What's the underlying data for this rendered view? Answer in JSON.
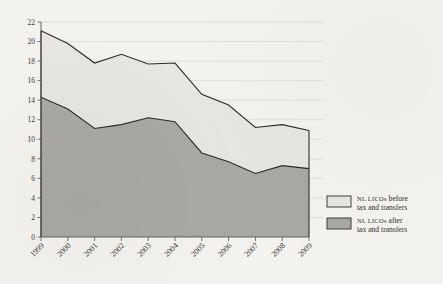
{
  "chart_data": {
    "type": "area",
    "title": "",
    "subtitle": "",
    "xlabel": "",
    "ylabel": "",
    "categories": [
      "1999",
      "2000",
      "2001",
      "2002",
      "2003",
      "2004",
      "2005",
      "2006",
      "2007",
      "2008",
      "2009"
    ],
    "x": [
      1999,
      2000,
      2001,
      2002,
      2003,
      2004,
      2005,
      2006,
      2007,
      2008,
      2009
    ],
    "series": [
      {
        "name": "NL LICOs before tax and transfers",
        "color": "#e6e5e2",
        "values": [
          21.1,
          19.8,
          17.8,
          18.7,
          17.7,
          17.8,
          14.6,
          13.5,
          11.2,
          11.5,
          10.9
        ]
      },
      {
        "name": "NL LICOs after tax and transfers",
        "color": "#a9a8a5",
        "values": [
          14.3,
          13.1,
          11.1,
          11.5,
          12.2,
          11.8,
          8.6,
          7.7,
          6.5,
          7.3,
          7.0
        ]
      }
    ],
    "ylim": [
      0,
      22
    ],
    "yticks": [
      0,
      2,
      4,
      6,
      8,
      10,
      12,
      14,
      16,
      18,
      20,
      22
    ],
    "ytick_labels": [
      "0",
      "2",
      "4",
      "6",
      "8",
      "10",
      "12",
      "14",
      "16",
      "18",
      "20",
      "22"
    ],
    "grid": "horizontal",
    "legend_position": "right",
    "stacked": false
  },
  "legend": {
    "items": [
      {
        "swatch_color": "#e6e5e2",
        "small_caps": "NL LICOs",
        "rest_line1": " before",
        "line2": "tax and transfers",
        "full_label": "NL LICOs before tax and transfers"
      },
      {
        "swatch_color": "#a9a8a5",
        "small_caps": "NL LICOs",
        "rest_line1": " after",
        "line2": "tax and transfers",
        "full_label": "NL LICOs after tax and transfers"
      }
    ]
  },
  "colors": {
    "background": "#f3f2ef",
    "grid": "#d8d6d1",
    "axis": "#55524d",
    "line": "#2e2b27",
    "before_fill": "#e6e5e2",
    "after_fill": "#a9a8a5",
    "text": "#2f2c28"
  }
}
